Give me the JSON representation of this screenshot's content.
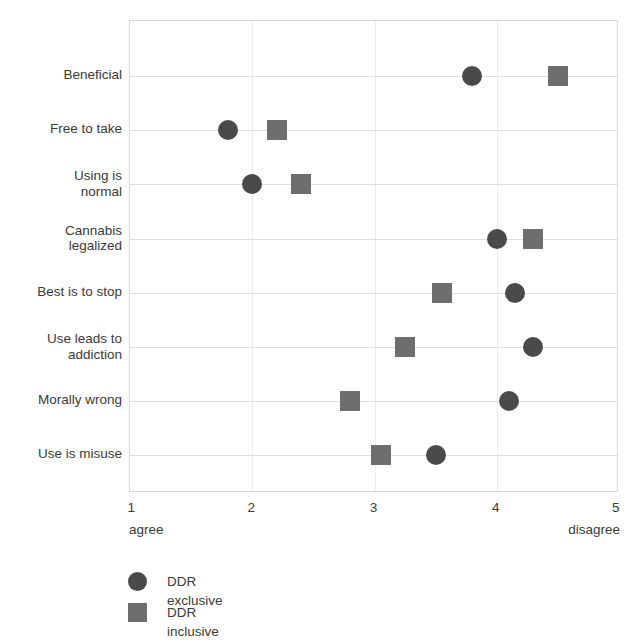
{
  "chart_data": {
    "type": "scatter",
    "title": "",
    "subtitle": "",
    "xlabel": "",
    "ylabel": "",
    "xlim": [
      1,
      5
    ],
    "xticks": [
      1,
      2,
      3,
      4,
      5
    ],
    "xtick_labels": [
      "1",
      "2",
      "3",
      "4",
      "5"
    ],
    "x_axis_low_anchor": "agree",
    "x_axis_high_anchor": "disagree",
    "grid": true,
    "legend_position": "bottom-left",
    "categories": [
      "Beneficial",
      "Free to take",
      "Using is\nnormal",
      "Cannabis\nlegalized",
      "Best is to stop",
      "Use leads to\naddiction",
      "Morally wrong",
      "Use is misuse"
    ],
    "series": [
      {
        "name": "DDR exclusive",
        "marker": "circle",
        "color": "#4a4a4a",
        "values": [
          3.8,
          1.8,
          2.0,
          4.0,
          4.15,
          4.3,
          4.1,
          3.5
        ]
      },
      {
        "name": "DDR inclusive",
        "marker": "square",
        "color": "#6e6e6e",
        "values": [
          4.5,
          2.2,
          2.4,
          4.3,
          3.55,
          3.25,
          2.8,
          3.05
        ]
      }
    ]
  },
  "legend": {
    "items": [
      {
        "label": "DDR exclusive",
        "marker": "circle"
      },
      {
        "label": "DDR inclusive",
        "marker": "square"
      }
    ]
  }
}
